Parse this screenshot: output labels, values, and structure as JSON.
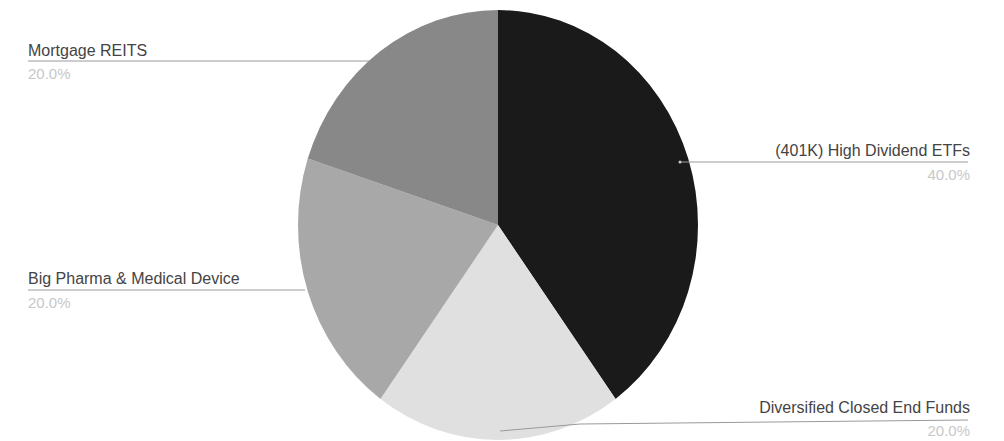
{
  "chart_data": {
    "type": "pie",
    "title": "",
    "start_angle_deg": 0,
    "direction": "clockwise",
    "slices": [
      {
        "label": "(401K) High Dividend ETFs",
        "value": 40.0,
        "percent_label": "40.0%",
        "color": "#1a1a1a"
      },
      {
        "label": "Diversified Closed End Funds",
        "value": 20.0,
        "percent_label": "20.0%",
        "color": "#e0e0e0"
      },
      {
        "label": "Big Pharma & Medical Device",
        "value": 20.0,
        "percent_label": "20.0%",
        "color": "#a8a8a8"
      },
      {
        "label": "Mortgage REITS",
        "value": 20.0,
        "percent_label": "20.0%",
        "color": "#888888"
      }
    ],
    "legend": "none",
    "labels": "outside with leader lines"
  },
  "labels": {
    "etfs": {
      "name": "(401K) High Dividend ETFs",
      "pct": "40.0%"
    },
    "cef": {
      "name": "Diversified Closed End Funds",
      "pct": "20.0%"
    },
    "pharma": {
      "name": "Big Pharma & Medical Device",
      "pct": "20.0%"
    },
    "reits": {
      "name": "Mortgage REITS",
      "pct": "20.0%"
    }
  }
}
